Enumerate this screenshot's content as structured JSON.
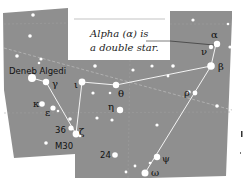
{
  "diagram": {
    "type": "star-chart",
    "constellation": "Capricornus",
    "colors": {
      "sky": "#8f8f8f",
      "star": "#ffffff",
      "line": "#ffffff",
      "text": "#111111",
      "callout_bg": "#ffffff",
      "dashed": "#b5b5b5"
    },
    "callout": {
      "line1": "Alpha (α) is",
      "line2": "a double star."
    },
    "labels": {
      "deneb_algedi": "Deneb Algedi",
      "m30": "M30",
      "n36": "36",
      "n24": "24"
    },
    "greek": {
      "alpha": "α",
      "beta": "β",
      "nu": "ν",
      "gamma": "γ",
      "iota": "ι",
      "theta": "θ",
      "eta": "η",
      "rho": "ρ",
      "kappa": "κ",
      "epsilon": "ε",
      "zeta": "ζ",
      "psi": "ψ",
      "omega": "ω"
    },
    "stars": [
      {
        "name": "alpha",
        "x": 216,
        "y": 44,
        "r": 3.2
      },
      {
        "name": "nu",
        "x": 211,
        "y": 47,
        "r": 2.2
      },
      {
        "name": "beta",
        "x": 211,
        "y": 66,
        "r": 3.8
      },
      {
        "name": "rho",
        "x": 195,
        "y": 93,
        "r": 2.4
      },
      {
        "name": "psi",
        "x": 157,
        "y": 158,
        "r": 3.2
      },
      {
        "name": "omega",
        "x": 145,
        "y": 173,
        "r": 3.5
      },
      {
        "name": "theta",
        "x": 116,
        "y": 85,
        "r": 3.2
      },
      {
        "name": "iota",
        "x": 82,
        "y": 82,
        "r": 3.4
      },
      {
        "name": "eta",
        "x": 120,
        "y": 110,
        "r": 3.2
      },
      {
        "name": "zeta",
        "x": 76,
        "y": 134,
        "r": 3.4
      },
      {
        "name": "gamma",
        "x": 46,
        "y": 82,
        "r": 3.2
      },
      {
        "name": "deneb_algedi",
        "x": 32,
        "y": 78,
        "r": 4.0
      },
      {
        "name": "kappa",
        "x": 42,
        "y": 104,
        "r": 2.8
      },
      {
        "name": "epsilon",
        "x": 53,
        "y": 108,
        "r": 2.6
      }
    ]
  }
}
